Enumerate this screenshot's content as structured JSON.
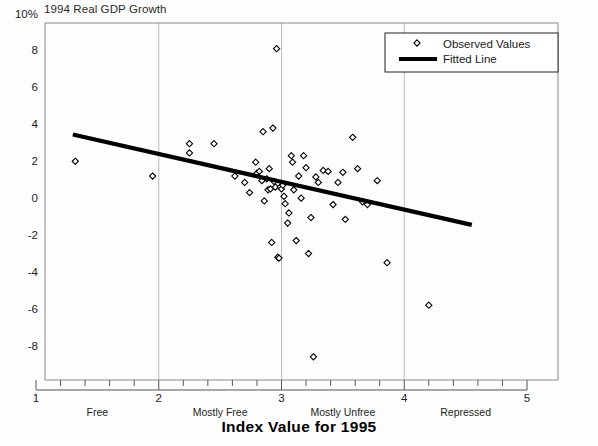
{
  "chart_data": {
    "type": "scatter",
    "title": "",
    "ylabel": "1994 Real GDP Growth",
    "xlabel": "Index Value for 1995",
    "xlim": [
      1,
      5
    ],
    "ylim": [
      -9.4,
      10
    ],
    "grid": "vertical gridlines at x = 2, 3, 4",
    "legend_position": "top-right inside plot",
    "y_ticks": [
      {
        "value": 10,
        "label": "10%"
      },
      {
        "value": 8,
        "label": "8"
      },
      {
        "value": 6,
        "label": "6"
      },
      {
        "value": 4,
        "label": "4"
      },
      {
        "value": 2,
        "label": "2"
      },
      {
        "value": 0,
        "label": "0"
      },
      {
        "value": -2,
        "label": "-2"
      },
      {
        "value": -4,
        "label": "-4"
      },
      {
        "value": -6,
        "label": "-6"
      },
      {
        "value": -8,
        "label": "-8"
      }
    ],
    "x_ticks": [
      {
        "value": 1,
        "label": "1"
      },
      {
        "value": 2,
        "label": "2"
      },
      {
        "value": 3,
        "label": "3"
      },
      {
        "value": 4,
        "label": "4"
      },
      {
        "value": 5,
        "label": "5"
      }
    ],
    "x_minor_tick_step": 0.2,
    "x_categories": [
      {
        "label": "Free",
        "center": 1.5
      },
      {
        "label": "Mostly Free",
        "center": 2.5
      },
      {
        "label": "Mostly Unfree",
        "center": 3.5
      },
      {
        "label": "Repressed",
        "center": 4.5
      }
    ],
    "series": [
      {
        "name": "Observed Values",
        "marker": "open-diamond",
        "color": "#000000",
        "points": [
          [
            1.32,
            2.1
          ],
          [
            1.95,
            1.3
          ],
          [
            2.25,
            3.05
          ],
          [
            2.25,
            2.55
          ],
          [
            2.45,
            3.05
          ],
          [
            2.62,
            1.3
          ],
          [
            2.7,
            0.95
          ],
          [
            2.74,
            0.4
          ],
          [
            2.79,
            2.05
          ],
          [
            2.8,
            1.45
          ],
          [
            2.82,
            1.55
          ],
          [
            2.84,
            1.05
          ],
          [
            2.85,
            3.7
          ],
          [
            2.86,
            -0.05
          ],
          [
            2.88,
            1.15
          ],
          [
            2.89,
            0.55
          ],
          [
            2.9,
            1.7
          ],
          [
            2.91,
            0.6
          ],
          [
            2.92,
            -2.3
          ],
          [
            2.93,
            3.9
          ],
          [
            2.94,
            1.0
          ],
          [
            2.95,
            0.7
          ],
          [
            2.96,
            8.2
          ],
          [
            2.97,
            -3.1
          ],
          [
            2.98,
            -3.15
          ],
          [
            2.99,
            0.7
          ],
          [
            3.0,
            0.6
          ],
          [
            3.01,
            0.8
          ],
          [
            3.02,
            0.2
          ],
          [
            3.03,
            -0.2
          ],
          [
            3.05,
            -1.25
          ],
          [
            3.06,
            -0.7
          ],
          [
            3.08,
            2.4
          ],
          [
            3.09,
            2.05
          ],
          [
            3.1,
            0.55
          ],
          [
            3.12,
            -2.2
          ],
          [
            3.14,
            1.3
          ],
          [
            3.16,
            0.1
          ],
          [
            3.18,
            2.4
          ],
          [
            3.2,
            1.75
          ],
          [
            3.22,
            -2.9
          ],
          [
            3.24,
            -0.95
          ],
          [
            3.26,
            -8.5
          ],
          [
            3.28,
            1.25
          ],
          [
            3.3,
            0.95
          ],
          [
            3.34,
            1.6
          ],
          [
            3.38,
            1.55
          ],
          [
            3.42,
            -0.25
          ],
          [
            3.46,
            0.95
          ],
          [
            3.5,
            1.5
          ],
          [
            3.52,
            -1.05
          ],
          [
            3.58,
            3.4
          ],
          [
            3.62,
            1.7
          ],
          [
            3.66,
            -0.1
          ],
          [
            3.7,
            -0.25
          ],
          [
            3.78,
            1.05
          ],
          [
            3.86,
            -3.4
          ],
          [
            4.2,
            -5.7
          ]
        ]
      }
    ],
    "fitted_line": {
      "name": "Fitted Line",
      "color": "#000000",
      "x_start": 1.3,
      "y_start": 3.55,
      "x_end": 4.55,
      "y_end": -1.35
    }
  },
  "legend": {
    "items": [
      {
        "label": "Observed Values",
        "marker": "open-diamond"
      },
      {
        "label": "Fitted Line",
        "marker": "thick-line"
      }
    ]
  }
}
